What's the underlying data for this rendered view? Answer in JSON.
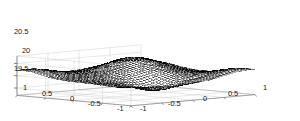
{
  "chart_data": {
    "type": "surface",
    "render": "mesh-wireframe",
    "title": "",
    "xlabel": "",
    "ylabel": "",
    "zlabel": "",
    "grid": true,
    "legend": false,
    "projection": "3d-axonometric",
    "view": {
      "azimuth": -37.5,
      "elevation": 30
    },
    "xlim": [
      -1,
      1
    ],
    "ylim": [
      -1,
      1
    ],
    "zlim": [
      19.2,
      20.8
    ],
    "x_ticks": [
      -1,
      -0.5,
      0,
      0.5,
      1
    ],
    "x_tick_labels": [
      "-1",
      "-0.5",
      "0",
      "0.5",
      "1"
    ],
    "y_ticks": [
      -1,
      -0.5,
      0,
      0.5,
      1
    ],
    "y_tick_labels": [
      "1",
      "0.5",
      "0",
      "-0.5",
      "-1"
    ],
    "z_ticks": [
      19.5,
      20,
      20.5
    ],
    "z_tick_labels": [
      "19.5",
      "20",
      "20.5"
    ],
    "mesh_rows": 41,
    "mesh_cols": 41,
    "surface_color": "#000000",
    "grid_color": "#c8c8c8",
    "axis_color": "#808080",
    "background_color": "#ffffff",
    "z_base": 20.0,
    "z_peak": 20.75,
    "z_trough": 19.35,
    "surface_terms": [
      {
        "amp": 0.42,
        "cx": 0.35,
        "cy": 0.45,
        "sx": 0.3,
        "sy": 0.3
      },
      {
        "amp": -0.5,
        "cx": -0.2,
        "cy": -0.5,
        "sx": 0.28,
        "sy": 0.28
      },
      {
        "amp": 0.2,
        "cx": -0.85,
        "cy": 0.85,
        "sx": 0.25,
        "sy": 0.25
      },
      {
        "amp": 0.2,
        "cx": 0.85,
        "cy": -0.85,
        "sx": 0.25,
        "sy": 0.25
      },
      {
        "amp": -0.18,
        "cx": -0.8,
        "cy": -0.8,
        "sx": 0.3,
        "sy": 0.3
      },
      {
        "amp": 0.16,
        "cx": 0.75,
        "cy": 0.75,
        "sx": 0.32,
        "sy": 0.32
      },
      {
        "amp": 0.14,
        "cx": 0.0,
        "cy": 0.0,
        "sx": 0.55,
        "sy": 0.55
      }
    ]
  },
  "axis_labels": {
    "z": [
      {
        "text": "20.5",
        "left": 14,
        "top": 28
      },
      {
        "text": "20",
        "left": 22,
        "top": 47
      },
      {
        "text": "19.5",
        "left": 14,
        "top": 65
      }
    ],
    "y_left": [
      {
        "text": "1",
        "left": 23,
        "top": 84
      },
      {
        "text": "0.5",
        "left": 42,
        "top": 90
      },
      {
        "text": "0",
        "left": 70,
        "top": 95
      },
      {
        "text": "-0.5",
        "left": 88,
        "top": 100
      },
      {
        "text": "-1",
        "left": 117,
        "top": 105
      }
    ],
    "x_right": [
      {
        "text": "-1",
        "left": 140,
        "top": 105
      },
      {
        "text": "-0.5",
        "left": 168,
        "top": 100
      },
      {
        "text": "0",
        "left": 203,
        "top": 95
      },
      {
        "text": "0.5",
        "left": 228,
        "top": 90
      },
      {
        "text": "1",
        "left": 263,
        "top": 84
      }
    ]
  }
}
